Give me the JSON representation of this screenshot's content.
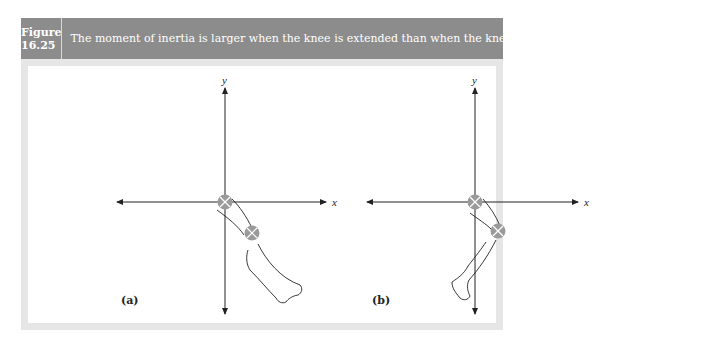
{
  "figure": {
    "number": "Figure 16.25",
    "caption": "The moment of inertia is larger when the knee is extended than when the knee is flexed.",
    "colors": {
      "header_bg": "#8c8c8c",
      "header_text": "#ffffff",
      "frame_border": "#e6e6e6",
      "joint_marker": "#9a9a9a",
      "axis": "#222222"
    }
  },
  "panels": [
    {
      "label": "(a)",
      "description": "Leg with knee extended, hinged at hip at origin",
      "axis_x_label": "x",
      "axis_y_label": "y"
    },
    {
      "label": "(b)",
      "description": "Leg with knee flexed, hinged at hip at origin",
      "axis_x_label": "x",
      "axis_y_label": "y"
    }
  ]
}
